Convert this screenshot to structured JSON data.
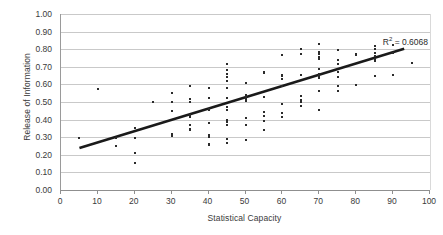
{
  "chart_data": {
    "type": "scatter",
    "title": "",
    "xlabel": "Statistical Capacity",
    "ylabel": "Release of Information",
    "xlim": [
      0,
      100
    ],
    "ylim": [
      0.0,
      1.0
    ],
    "x_ticks": [
      0,
      10,
      20,
      30,
      40,
      50,
      60,
      70,
      80,
      90,
      100
    ],
    "y_ticks": [
      "0.00",
      "0.10",
      "0.20",
      "0.30",
      "0.40",
      "0.50",
      "0.60",
      "0.70",
      "0.80",
      "0.90",
      "1.00"
    ],
    "grid": true,
    "legend": false,
    "annotations": [
      {
        "name": "r-squared",
        "text_prefix": "R",
        "text_sup": "2",
        "text_suffix": " = 0.6068",
        "value": 0.6068
      }
    ],
    "trendline": {
      "type": "linear",
      "x_start": 5,
      "y_start": 0.238,
      "x_end": 93,
      "y_end": 0.803,
      "color": "#1a1a1a",
      "width": 2.6
    },
    "point_color": "#2b2b2b",
    "points": [
      [
        5,
        0.293
      ],
      [
        10,
        0.572
      ],
      [
        15,
        0.295
      ],
      [
        15,
        0.251
      ],
      [
        20,
        0.355
      ],
      [
        20,
        0.294
      ],
      [
        20,
        0.208
      ],
      [
        20,
        0.156
      ],
      [
        25,
        0.498
      ],
      [
        30,
        0.553
      ],
      [
        30,
        0.501
      ],
      [
        30,
        0.449
      ],
      [
        30,
        0.32
      ],
      [
        30,
        0.309
      ],
      [
        35,
        0.593
      ],
      [
        35,
        0.518
      ],
      [
        35,
        0.5
      ],
      [
        35,
        0.425
      ],
      [
        35,
        0.414
      ],
      [
        35,
        0.371
      ],
      [
        35,
        0.348
      ],
      [
        35,
        0.339
      ],
      [
        40,
        0.578
      ],
      [
        40,
        0.522
      ],
      [
        40,
        0.462
      ],
      [
        40,
        0.455
      ],
      [
        40,
        0.378
      ],
      [
        40,
        0.31
      ],
      [
        40,
        0.301
      ],
      [
        40,
        0.262
      ],
      [
        40,
        0.253
      ],
      [
        45,
        0.716
      ],
      [
        45,
        0.681
      ],
      [
        45,
        0.66
      ],
      [
        45,
        0.64
      ],
      [
        45,
        0.621
      ],
      [
        45,
        0.578
      ],
      [
        45,
        0.525
      ],
      [
        45,
        0.472
      ],
      [
        45,
        0.455
      ],
      [
        45,
        0.4
      ],
      [
        45,
        0.385
      ],
      [
        45,
        0.37
      ],
      [
        45,
        0.292
      ],
      [
        45,
        0.267
      ],
      [
        50,
        0.606
      ],
      [
        50,
        0.54
      ],
      [
        50,
        0.527
      ],
      [
        50,
        0.518
      ],
      [
        50,
        0.508
      ],
      [
        50,
        0.408
      ],
      [
        50,
        0.368
      ],
      [
        50,
        0.286
      ],
      [
        55,
        0.67
      ],
      [
        55,
        0.664
      ],
      [
        55,
        0.529
      ],
      [
        55,
        0.443
      ],
      [
        55,
        0.421
      ],
      [
        55,
        0.391
      ],
      [
        55,
        0.34
      ],
      [
        60,
        0.766
      ],
      [
        60,
        0.655
      ],
      [
        60,
        0.645
      ],
      [
        60,
        0.63
      ],
      [
        60,
        0.59
      ],
      [
        60,
        0.49
      ],
      [
        60,
        0.44
      ],
      [
        60,
        0.417
      ],
      [
        65,
        0.8
      ],
      [
        65,
        0.77
      ],
      [
        65,
        0.651
      ],
      [
        65,
        0.533
      ],
      [
        65,
        0.512
      ],
      [
        65,
        0.5
      ],
      [
        65,
        0.477
      ],
      [
        70,
        0.83
      ],
      [
        70,
        0.782
      ],
      [
        70,
        0.77
      ],
      [
        70,
        0.757
      ],
      [
        70,
        0.745
      ],
      [
        70,
        0.69
      ],
      [
        70,
        0.66
      ],
      [
        70,
        0.645
      ],
      [
        70,
        0.635
      ],
      [
        70,
        0.56
      ],
      [
        70,
        0.452
      ],
      [
        75,
        0.795
      ],
      [
        75,
        0.74
      ],
      [
        75,
        0.716
      ],
      [
        75,
        0.672
      ],
      [
        75,
        0.64
      ],
      [
        75,
        0.592
      ],
      [
        75,
        0.563
      ],
      [
        80,
        0.775
      ],
      [
        80,
        0.768
      ],
      [
        80,
        0.597
      ],
      [
        85,
        0.818
      ],
      [
        85,
        0.8
      ],
      [
        85,
        0.78
      ],
      [
        85,
        0.762
      ],
      [
        85,
        0.745
      ],
      [
        85,
        0.732
      ],
      [
        85,
        0.646
      ],
      [
        90,
        0.825
      ],
      [
        90,
        0.78
      ],
      [
        90,
        0.651
      ],
      [
        95,
        0.724
      ]
    ]
  }
}
